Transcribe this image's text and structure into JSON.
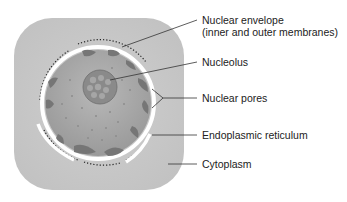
{
  "diagram": {
    "labels": [
      {
        "id": "nuclear-envelope",
        "line1": "Nuclear envelope",
        "line2": "(inner and outer membranes)"
      },
      {
        "id": "nucleolus",
        "line1": "Nucleolus"
      },
      {
        "id": "nuclear-pores",
        "line1": "Nuclear pores"
      },
      {
        "id": "endoplasmic-reticulum",
        "line1": "Endoplasmic reticulum"
      },
      {
        "id": "cytoplasm",
        "line1": "Cytoplasm"
      }
    ],
    "colors": {
      "cytoplasm": "#c8c8c8",
      "nucleoplasm": "#a8a8a8",
      "chromatin": "#7a7a7a",
      "nucleolus": "#8a8a8a",
      "membrane": "#ffffff",
      "leader_line": "#333333"
    }
  }
}
